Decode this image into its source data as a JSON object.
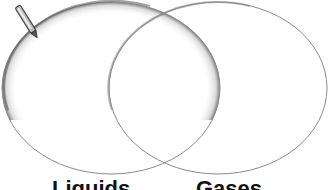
{
  "diagram": {
    "type": "venn",
    "sets": [
      {
        "id": "left",
        "label": "Liquids",
        "cx": 111,
        "cy": 88,
        "rx": 109,
        "ry": 86
      },
      {
        "id": "right",
        "label": "Gases",
        "cx": 218,
        "cy": 88,
        "rx": 109,
        "ry": 86
      }
    ],
    "labels": {
      "left": "Liquids",
      "right": "Gases"
    },
    "icons": {
      "pencil": "pencil-icon"
    },
    "colors": {
      "stroke": "#8a8a8a",
      "shadow": "#6a6a6a",
      "background": "#ffffff",
      "text": "#111111"
    }
  }
}
